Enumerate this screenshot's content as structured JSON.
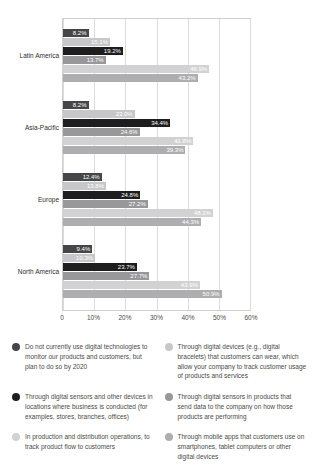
{
  "chart_data": {
    "type": "bar",
    "orientation": "horizontal",
    "title": "",
    "xlabel": "",
    "ylabel": "",
    "xlim": [
      0,
      60
    ],
    "x_ticks": [
      "0",
      "10%",
      "20%",
      "30%",
      "40%",
      "50%",
      "60%"
    ],
    "grid": "vertical",
    "legend_position": "bottom",
    "categories": [
      "Latin America",
      "Asia-Pacific",
      "Europe",
      "North America"
    ],
    "series": [
      {
        "name": "Do not currently use digital technologies to monitor our products and customers, but plan to do so by 2020",
        "color": "#464648",
        "values": [
          8.2,
          8.2,
          12.4,
          9.4
        ]
      },
      {
        "name": "Through digital devices (e.g., digital bracelets) that customers can wear, which allow your company to track customer usage of products and services",
        "color": "#c7c7c9",
        "values": [
          15.1,
          23.0,
          13.8,
          10.3
        ]
      },
      {
        "name": "Through digital sensors and other devices in locations where business is conducted (for examples, stores, branches, offices)",
        "color": "#1e1e1e",
        "values": [
          19.2,
          34.4,
          24.8,
          23.7
        ]
      },
      {
        "name": "Through digital sensors in products that send data to the company on how those products are performing",
        "color": "#98989a",
        "values": [
          13.7,
          24.6,
          27.2,
          27.7
        ]
      },
      {
        "name": "In production and distribution operations, to track product flow to customers",
        "color": "#d2d2d3",
        "values": [
          46.9,
          41.8,
          48.1,
          43.9
        ]
      },
      {
        "name": "Through mobile apps that customers use on smartphones, tablet computers or other digital devices",
        "color": "#aeaeb0",
        "values": [
          43.2,
          39.3,
          44.3,
          50.9
        ]
      }
    ],
    "value_suffix": "%"
  }
}
